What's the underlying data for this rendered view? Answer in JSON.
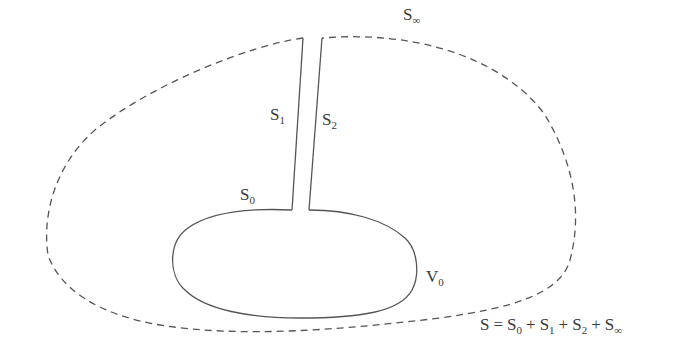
{
  "diagram": {
    "title": "",
    "stroke_color": "#555555",
    "label_color": "#3a3a3a",
    "labels": {
      "s_inf": {
        "base": "S",
        "sub": "∞"
      },
      "s1": {
        "base": "S",
        "sub": "1"
      },
      "s2": {
        "base": "S",
        "sub": "2"
      },
      "s0": {
        "base": "S",
        "sub": "0"
      },
      "v0": {
        "base": "V",
        "sub": "0"
      }
    },
    "equation": {
      "lhs": "S",
      "eq": "=",
      "terms": [
        {
          "base": "S",
          "sub": "0"
        },
        {
          "base": "S",
          "sub": "1"
        },
        {
          "base": "S",
          "sub": "2"
        },
        {
          "base": "S",
          "sub": "∞"
        }
      ],
      "plus": "+"
    },
    "elements": [
      {
        "id": "outer-surface",
        "style": "dashed",
        "label": "S∞"
      },
      {
        "id": "cut-left",
        "style": "solid",
        "label": "S1"
      },
      {
        "id": "cut-right",
        "style": "solid",
        "label": "S2"
      },
      {
        "id": "inner-surface",
        "style": "solid",
        "label": "S0",
        "encloses": "V0"
      }
    ]
  }
}
